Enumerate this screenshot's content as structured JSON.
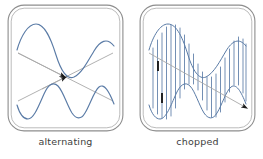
{
  "figure": {
    "background_color": "#ffffff",
    "width": 263,
    "height": 159
  },
  "style": {
    "trace_color": "#5a7ba6",
    "frame_outer_color": "#8d8d8d",
    "frame_inner_color": "#b3b3b3",
    "arrow_line_color": "#a8a8a8",
    "arrow_head_color": "#1a1a1a",
    "caption_color": "#3d3d3d"
  },
  "panels": [
    {
      "id": "alternating",
      "caption": "alternating",
      "mode_description": "Two complete sweeps drawn one after the other; beam alternates between channel 1 and channel 2 on successive sweeps.",
      "traces": [
        {
          "name": "channel-1",
          "position": "upper",
          "shape": "sine",
          "cycles": 1.5,
          "amplitude": 23,
          "baseline_y": 37,
          "phase_deg": 180
        },
        {
          "name": "channel-2",
          "position": "lower",
          "shape": "sine",
          "cycles": 2.0,
          "amplitude": 17,
          "baseline_y": 88,
          "phase_deg": 0
        }
      ],
      "arrows": [
        {
          "name": "sweep-arrow-down",
          "from": [
            6,
            44
          ],
          "to": [
            101,
            92
          ],
          "head_at_fraction": 0.47
        },
        {
          "name": "sweep-arrow-up",
          "from": [
            6,
            92
          ],
          "to": [
            101,
            44
          ],
          "head_at_fraction": 0.47
        }
      ]
    },
    {
      "id": "chopped",
      "caption": "chopped",
      "mode_description": "Beam is switched rapidly between channel 1 and channel 2 during a single sweep, leaving vertical connecting segments.",
      "traces": [
        {
          "name": "channel-1",
          "position": "upper",
          "shape": "sine",
          "cycles": 1.5,
          "amplitude": 23,
          "baseline_y": 37,
          "phase_deg": 180
        },
        {
          "name": "channel-2",
          "position": "lower",
          "shape": "sine",
          "cycles": 2.0,
          "amplitude": 17,
          "baseline_y": 88,
          "phase_deg": 0
        }
      ],
      "chop_segment_count": 22,
      "arrows": [
        {
          "name": "sweep-arrow-down",
          "from": [
            6,
            44
          ],
          "to": [
            101,
            98
          ],
          "head_at_fraction": 0.93
        }
      ],
      "chop_markers": [
        {
          "name": "chop-marker-upper",
          "x": 14,
          "y_top": 52,
          "y_bottom": 62
        },
        {
          "name": "chop-marker-lower",
          "x": 18,
          "y_top": 84,
          "y_bottom": 94
        }
      ]
    }
  ]
}
